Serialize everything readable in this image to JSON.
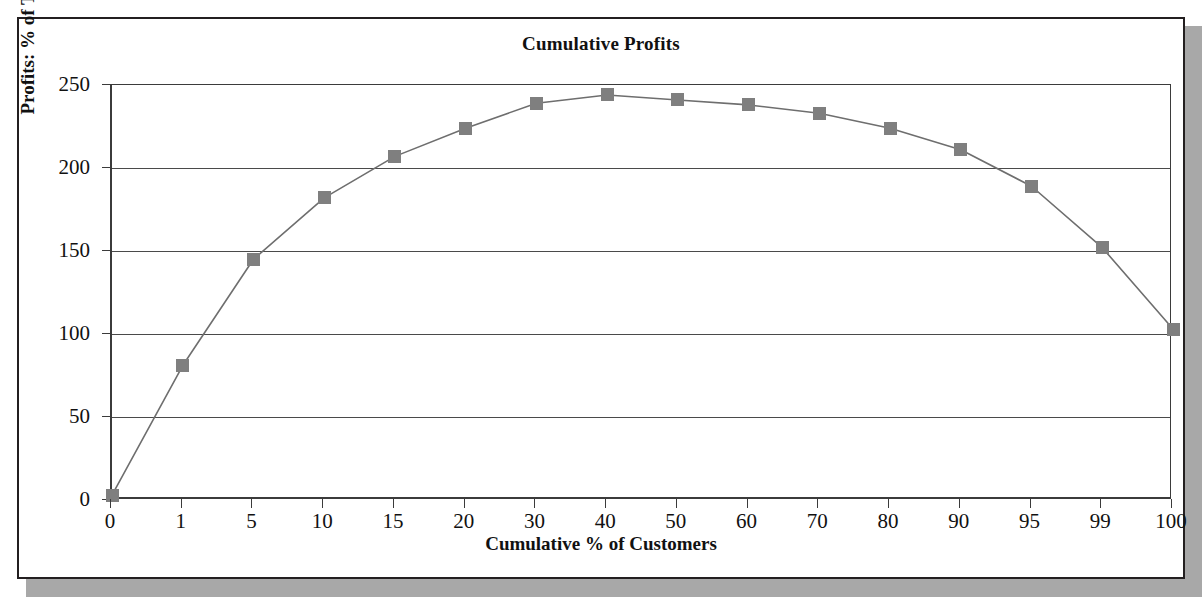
{
  "figure": {
    "title": "Cumulative Profits",
    "frame_color": "#231f20",
    "shadow_color": "#a8a8a8",
    "background": "#ffffff"
  },
  "chart_data": {
    "type": "line",
    "title": "Cumulative Profits",
    "xlabel": "Cumulative % of Customers",
    "ylabel": "Profits: % of Total",
    "categories": [
      "0",
      "1",
      "5",
      "10",
      "15",
      "20",
      "30",
      "40",
      "50",
      "60",
      "70",
      "80",
      "90",
      "95",
      "99",
      "100"
    ],
    "values": [
      3,
      81,
      145,
      182,
      207,
      224,
      239,
      244,
      241,
      238,
      233,
      224,
      211,
      189,
      152,
      103
    ],
    "series": [
      {
        "name": "Cumulative Profits",
        "values": [
          3,
          81,
          145,
          182,
          207,
          224,
          239,
          244,
          241,
          238,
          233,
          224,
          211,
          189,
          152,
          103
        ],
        "marker": "square",
        "marker_color": "#7f7f7f",
        "line_color": "#6e6e6e"
      }
    ],
    "ylim": [
      0,
      250
    ],
    "yticks": [
      0,
      50,
      100,
      150,
      200,
      250
    ],
    "ytick_labels": [
      "0",
      "50",
      "100",
      "150",
      "200",
      "250"
    ],
    "grid": true,
    "grid_axis": "y",
    "legend": false,
    "legend_position": "none",
    "xaxis_type": "category"
  }
}
